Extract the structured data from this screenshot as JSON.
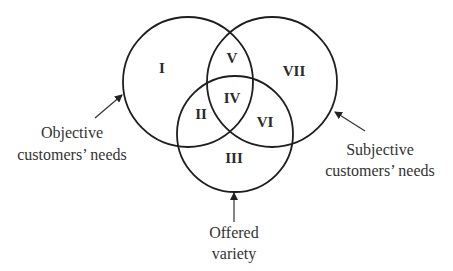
{
  "diagram": {
    "type": "venn",
    "colors": {
      "stroke": "#1e1e1e",
      "text": "#333333",
      "background": "#ffffff"
    },
    "sets": [
      {
        "id": "objective",
        "label_lines": [
          "Objective",
          "customers’ needs"
        ]
      },
      {
        "id": "subjective",
        "label_lines": [
          "Subjective",
          "customers’ needs"
        ]
      },
      {
        "id": "offered",
        "label_lines": [
          "Offered",
          "variety"
        ]
      }
    ],
    "regions": {
      "I": "I",
      "II": "II",
      "III": "III",
      "IV": "IV",
      "V": "V",
      "VI": "VI",
      "VII": "VII"
    }
  }
}
